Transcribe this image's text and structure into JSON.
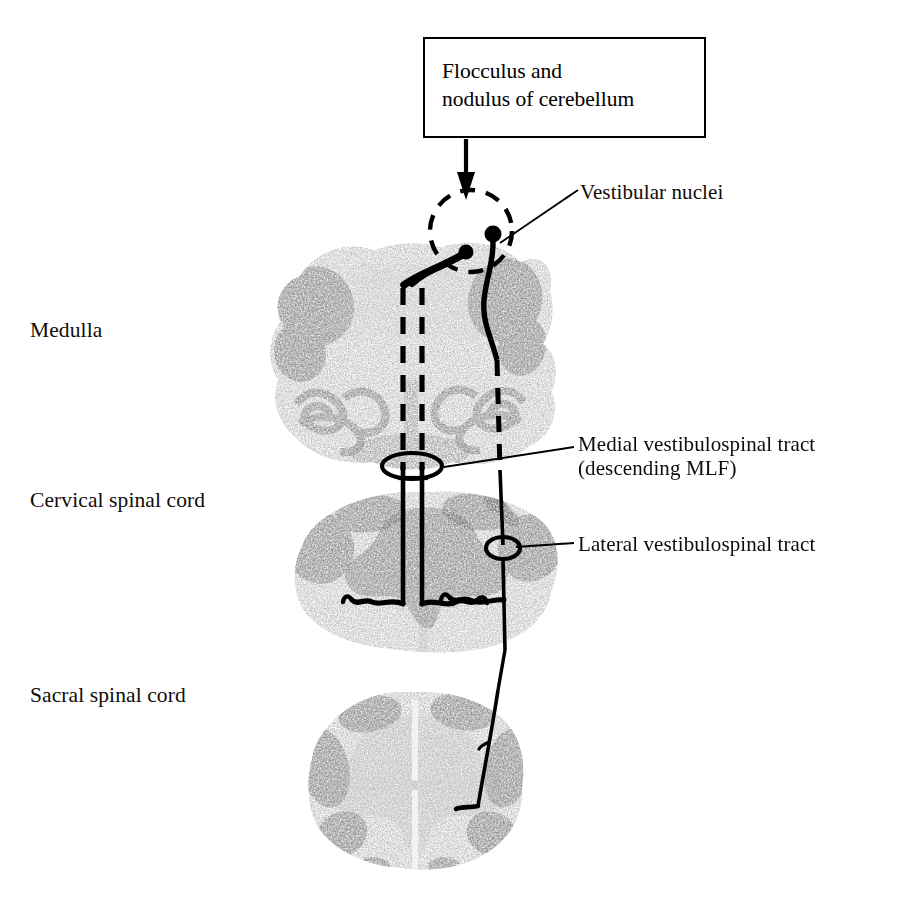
{
  "figure": {
    "background_color": "#ffffff",
    "ink_color": "#000000",
    "width": 914,
    "height": 916
  },
  "callout": {
    "line1": "Flocculus and",
    "line2": "nodulus of cerebellum",
    "box_border_color": "#000000"
  },
  "section_labels": [
    {
      "id": "medulla",
      "label": "Medulla"
    },
    {
      "id": "cervical",
      "label": "Cervical spinal cord"
    },
    {
      "id": "sacral",
      "label": "Sacral spinal cord"
    }
  ],
  "structure_labels": [
    {
      "id": "vestibular-nuclei",
      "line1": "Vestibular nuclei",
      "line2": ""
    },
    {
      "id": "medial-vestibulospinal-tract",
      "line1": "Medial vestibulospinal tract",
      "line2": "(descending MLF)"
    },
    {
      "id": "lateral-vestibulospinal-tract",
      "line1": "Lateral vestibulospinal tract",
      "line2": ""
    }
  ],
  "anatomy": {
    "sections": [
      {
        "id": "medulla-section",
        "name": "Medulla",
        "cx": 408,
        "cy": 357,
        "rx": 143,
        "ry": 113
      },
      {
        "id": "cervical-section",
        "name": "Cervical spinal cord",
        "cx": 424,
        "cy": 572,
        "rx": 134,
        "ry": 82
      },
      {
        "id": "sacral-section",
        "name": "Sacral spinal cord",
        "cx": 415,
        "cy": 780,
        "rx": 110,
        "ry": 90
      }
    ],
    "vestibular_nuclei_circle": {
      "cx": 471,
      "cy": 231,
      "r": 41,
      "style": "dashed"
    },
    "neurons": [
      {
        "id": "mvst-neuron",
        "cx": 466,
        "cy": 252,
        "r": 7
      },
      {
        "id": "lvst-neuron",
        "cx": 493,
        "cy": 234,
        "r": 8
      }
    ],
    "tracts": [
      {
        "id": "medial-vestibulospinal-tract",
        "style": "dashed-in-medulla",
        "side": "midline"
      },
      {
        "id": "lateral-vestibulospinal-tract",
        "style": "solid",
        "side": "right"
      }
    ]
  }
}
